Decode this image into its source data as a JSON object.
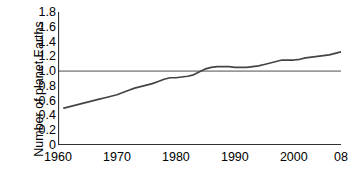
{
  "chart_data": {
    "type": "line",
    "title": "",
    "xlabel": "",
    "ylabel": "Number of planet Earths",
    "xlim": [
      1960,
      2008
    ],
    "ylim": [
      0,
      1.8
    ],
    "grid": false,
    "legend": null,
    "xticks": [
      {
        "value": 1960,
        "label": "1960"
      },
      {
        "value": 1970,
        "label": "1970"
      },
      {
        "value": 1980,
        "label": "1980"
      },
      {
        "value": 1990,
        "label": "1990"
      },
      {
        "value": 2000,
        "label": "2000"
      },
      {
        "value": 2008,
        "label": "08"
      }
    ],
    "yticks": [
      {
        "value": 1.8,
        "label": "1.8"
      },
      {
        "value": 1.6,
        "label": "1.6"
      },
      {
        "value": 1.4,
        "label": "1.4"
      },
      {
        "value": 1.2,
        "label": "1.2"
      },
      {
        "value": 1.0,
        "label": "1.0"
      },
      {
        "value": 0.8,
        "label": "0.8"
      },
      {
        "value": 0.6,
        "label": "0.6"
      },
      {
        "value": 0.4,
        "label": "0.4"
      },
      {
        "value": 0.2,
        "label": "0.2"
      },
      {
        "value": 0,
        "label": "0"
      }
    ],
    "reference_lines": [
      {
        "axis": "y",
        "value": 1.0,
        "color": "#999999",
        "width": 1.6
      }
    ],
    "series": [
      {
        "name": "Ecological footprint",
        "color": "#444444",
        "width": 1.7,
        "x": [
          1961,
          1962,
          1963,
          1964,
          1965,
          1966,
          1967,
          1968,
          1969,
          1970,
          1971,
          1972,
          1973,
          1974,
          1975,
          1976,
          1977,
          1978,
          1979,
          1980,
          1981,
          1982,
          1983,
          1984,
          1985,
          1986,
          1987,
          1988,
          1989,
          1990,
          1991,
          1992,
          1993,
          1994,
          1995,
          1996,
          1997,
          1998,
          1999,
          2000,
          2001,
          2002,
          2003,
          2004,
          2005,
          2006,
          2007,
          2008
        ],
        "y": [
          0.5,
          0.52,
          0.54,
          0.56,
          0.58,
          0.6,
          0.62,
          0.64,
          0.66,
          0.68,
          0.71,
          0.74,
          0.77,
          0.79,
          0.81,
          0.83,
          0.86,
          0.89,
          0.91,
          0.91,
          0.92,
          0.93,
          0.95,
          0.99,
          1.03,
          1.05,
          1.06,
          1.06,
          1.06,
          1.05,
          1.05,
          1.05,
          1.06,
          1.07,
          1.09,
          1.11,
          1.13,
          1.15,
          1.15,
          1.15,
          1.16,
          1.18,
          1.19,
          1.2,
          1.21,
          1.22,
          1.24,
          1.26
        ]
      }
    ]
  }
}
